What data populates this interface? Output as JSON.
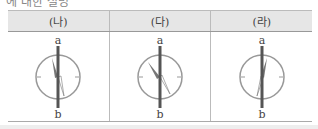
{
  "top_text": "에 대한 설명",
  "table": {
    "headers": [
      "(나)",
      "(다)",
      "(라)"
    ],
    "cells": [
      {
        "label_top": "a",
        "label_bottom": "b",
        "needle_direction": "tilted-left-top"
      },
      {
        "label_top": "a",
        "label_bottom": "b",
        "needle_direction": "tilted-left-strong"
      },
      {
        "label_top": "a",
        "label_bottom": "b",
        "needle_direction": "tilted-right-top"
      }
    ]
  },
  "colors": {
    "header_bg": "#e6e6e6",
    "wire": "#555555",
    "compass": "#999999"
  }
}
